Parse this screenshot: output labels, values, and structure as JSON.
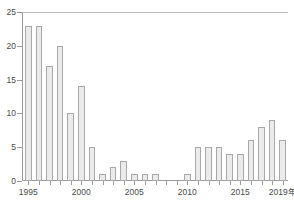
{
  "chart_data": {
    "type": "bar",
    "title": "",
    "xlabel": "年",
    "ylabel": "",
    "categories": [
      "1995",
      "1996",
      "1997",
      "1998",
      "1999",
      "2000",
      "2001",
      "2002",
      "2003",
      "2004",
      "2005",
      "2006",
      "2007",
      "2008",
      "2009",
      "2010",
      "2011",
      "2012",
      "2013",
      "2014",
      "2015",
      "2016",
      "2017",
      "2018",
      "2019"
    ],
    "values": [
      23,
      23,
      17,
      20,
      10,
      14,
      5,
      1,
      2,
      3,
      1,
      1,
      1,
      0,
      0,
      1,
      5,
      5,
      5,
      4,
      4,
      6,
      8,
      9,
      6
    ],
    "ylim": [
      0,
      25
    ],
    "xlim": [
      "1995",
      "2019"
    ],
    "y_ticks": [
      "0",
      "5",
      "10",
      "15",
      "20",
      "25"
    ],
    "y_tick_values": [
      0,
      5,
      10,
      15,
      20,
      25
    ],
    "x_ticks": [
      "1995",
      "2000",
      "2005",
      "2010",
      "2015",
      "2019年"
    ],
    "x_tick_values": [
      1995,
      2000,
      2005,
      2010,
      2015,
      2019
    ],
    "grid": false,
    "legend": [],
    "legend_position": "none",
    "bar_fill_color": "#ebebeb",
    "bar_border_color": "#a8a8a8",
    "axis_color": "#9b9b9b",
    "text_color": "#4a4a4a"
  },
  "title_strip": {
    "cropped_text": ""
  }
}
